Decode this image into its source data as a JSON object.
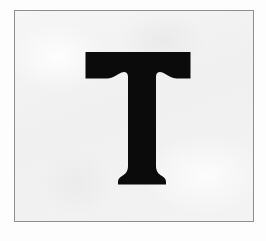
{
  "image": {
    "kind": "scanned-letter-card",
    "description": "A light gray card with a thin gray rectangular border containing a single large black serif capital letter",
    "width": 266,
    "height": 241
  },
  "canvas": {
    "background_color": "#fdfdfd"
  },
  "card": {
    "border_color": "#8e8e90",
    "border_width": 1,
    "background_color": "#f2f2f2",
    "left": 14,
    "top": 10,
    "width": 240,
    "height": 212
  },
  "glyph": {
    "character": "T",
    "name": "capital-letter-t",
    "color": "#0b0b0b",
    "style": "serif-slab-bracketed",
    "left": 84,
    "top": 52,
    "width": 106,
    "height": 132,
    "stem_width": 29,
    "cap_bar_height": 20,
    "foot_width": 48
  }
}
